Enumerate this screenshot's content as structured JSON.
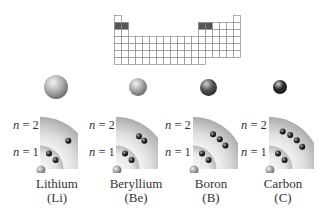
{
  "periodic_table": {
    "origin": [
      114,
      15
    ],
    "cell": 7,
    "highlight_color": "#555555",
    "highlighted_cells": [
      [
        2,
        1
      ],
      [
        2,
        2
      ],
      [
        2,
        13
      ],
      [
        2,
        14
      ]
    ]
  },
  "shell_labels": {
    "outer": "n = 2",
    "inner": "n = 1",
    "outer_italic": "n",
    "outer_rest": " = 2",
    "inner_italic": "n",
    "inner_rest": " = 1"
  },
  "elements": [
    {
      "name": "Lithium",
      "symbol": "(Li)",
      "atom_radius": 12,
      "atom_color": "#a8a8a8",
      "n1_electrons": 2,
      "n2_electrons": 1
    },
    {
      "name": "Beryllium",
      "symbol": "(Be)",
      "atom_radius": 9,
      "atom_color": "#a0a0a0",
      "n1_electrons": 2,
      "n2_electrons": 2
    },
    {
      "name": "Boron",
      "symbol": "(B)",
      "atom_radius": 8.5,
      "atom_color": "#555555",
      "n1_electrons": 2,
      "n2_electrons": 3
    },
    {
      "name": "Carbon",
      "symbol": "(C)",
      "atom_radius": 7,
      "atom_color": "#2a2a2a",
      "n1_electrons": 2,
      "n2_electrons": 4
    }
  ]
}
